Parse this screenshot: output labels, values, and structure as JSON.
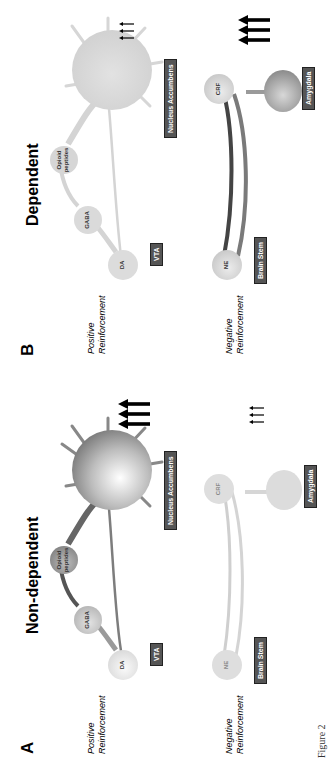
{
  "figure": {
    "caption": "Figure 2"
  },
  "panels": [
    {
      "letter": "A",
      "title": "Non-dependent",
      "positive_label": [
        "Positive",
        "Reinforcement"
      ],
      "negative_label": [
        "Negative",
        "Reinforcement"
      ],
      "neurons": {
        "da": "DA",
        "gaba": "GABA",
        "opioid": [
          "Opioid",
          "peptides"
        ],
        "nacc": "",
        "ne": "NE",
        "crf": "CRF"
      },
      "regions": {
        "vta": "VTA",
        "nacc": "Nucleus Accumbens",
        "brainstem": "Brain Stem",
        "amygdala": "Amygdala"
      },
      "positive_arrows": "large",
      "negative_arrows": "small",
      "positive_circuit_state": "active",
      "negative_circuit_state": "faint"
    },
    {
      "letter": "B",
      "title": "Dependent",
      "positive_label": [
        "Positive",
        "Reinforcement"
      ],
      "negative_label": [
        "Negative",
        "Reinforcement"
      ],
      "neurons": {
        "da": "DA",
        "gaba": "GABA",
        "opioid": [
          "Opioid",
          "peptides"
        ],
        "ne": "NE",
        "crf": "CRF"
      },
      "regions": {
        "vta": "VTA",
        "nacc": "Nucleus Accumbens",
        "brainstem": "Brain Stem",
        "amygdala": "Amygdala"
      },
      "positive_arrows": "small",
      "negative_arrows": "large",
      "positive_circuit_state": "faint",
      "negative_circuit_state": "active"
    }
  ],
  "colors": {
    "active_dark": "#555555",
    "active_mid": "#9a9a9a",
    "faint": "#d4d4d4",
    "label_bg": "#555555"
  }
}
